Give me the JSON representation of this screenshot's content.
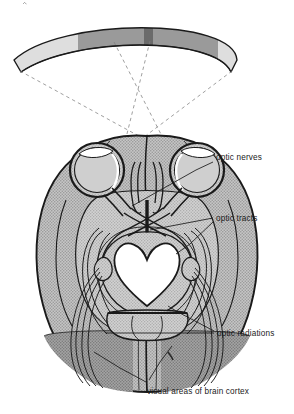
{
  "figure": {
    "view": "axial section of brain with eyes and visual field arc",
    "background_color": "#ffffff",
    "ink_color": "#1a1a1a"
  },
  "visual_field_arc": {
    "name": "visual field band",
    "segments": [
      {
        "id": "far-left",
        "label": "left peripheral field",
        "color": "#dedede"
      },
      {
        "id": "mid-left",
        "label": "left binocular field",
        "color": "#9a9a9a"
      },
      {
        "id": "center",
        "label": "fixation point",
        "color": "#6b6b6b"
      },
      {
        "id": "mid-right",
        "label": "right binocular field",
        "color": "#9a9a9a"
      },
      {
        "id": "far-right",
        "label": "right peripheral field",
        "color": "#dedede"
      }
    ],
    "sight_lines": {
      "style": "dashed",
      "count": 4,
      "color": "#7a7a7a"
    }
  },
  "brain": {
    "cortex_fill": "#b9b9b9",
    "inner_fill": "#c9c9c9",
    "visual_cortex_fill": "#9b9b9b",
    "midbrain_fill": "#ffffff",
    "outline_color": "#1a1a1a",
    "structures": [
      {
        "id": "eye-left",
        "label": "left eyeball"
      },
      {
        "id": "eye-right",
        "label": "right eyeball"
      },
      {
        "id": "optic-chiasm",
        "label": "optic chiasm"
      },
      {
        "id": "midbrain",
        "label": "midbrain"
      },
      {
        "id": "cerebellum",
        "label": "cerebellum"
      },
      {
        "id": "occipital-lobe-left",
        "label": "left occipital lobe"
      },
      {
        "id": "occipital-lobe-right",
        "label": "right occipital lobe"
      }
    ]
  },
  "labels": [
    {
      "id": "optic-nerves",
      "text": "optic nerves"
    },
    {
      "id": "optic-tracts",
      "text": "optic tracts"
    },
    {
      "id": "optic-radiations",
      "text": "optic radiations"
    },
    {
      "id": "visual-areas",
      "text": "visual areas of brain cortex"
    }
  ]
}
